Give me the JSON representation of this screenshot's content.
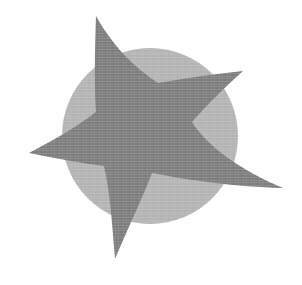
{
  "artwork": {
    "title": "Abstract star and circle graphic",
    "description": "A light gray filled circle overlaid by a larger dark gray five-pointed star with slightly curved, organic arms, on a plain white background.",
    "background_color": "#ffffff",
    "width": 302,
    "height": 285
  },
  "shapes": {
    "circle": {
      "name": "Light gray circle",
      "fill": "#b2b2b2",
      "center_x": 150,
      "center_y": 136,
      "radius": 88
    },
    "star": {
      "name": "Dark gray five-pointed star",
      "fill": "#7b7b7b",
      "point_count": 5,
      "outer_points": [
        {
          "label": "top",
          "x": 96,
          "y": 16
        },
        {
          "label": "upper-right",
          "x": 243,
          "y": 71
        },
        {
          "label": "lower-right",
          "x": 283,
          "y": 188
        },
        {
          "label": "bottom",
          "x": 115,
          "y": 259
        },
        {
          "label": "left",
          "x": 29,
          "y": 153
        }
      ],
      "inner_points": [
        {
          "label": "top-to-upper-right",
          "x": 158,
          "y": 83
        },
        {
          "label": "upper-right-to-lower-right",
          "x": 192,
          "y": 122
        },
        {
          "label": "lower-right-to-bottom",
          "x": 152,
          "y": 173
        },
        {
          "label": "bottom-to-left",
          "x": 104,
          "y": 166
        },
        {
          "label": "left-to-top",
          "x": 96,
          "y": 112
        }
      ],
      "path": "M 96 16 C 112 44 130 64 158 83 C 186 78 214 74 243 71 C 222 90 206 106 192 122 C 207 146 240 170 283 188 C 236 187 188 180 152 173 C 142 199 128 228 115 259 C 112 222 110 192 104 166 C 80 163 54 158 29 153 C 54 140 78 126 96 112 C 94 82 95 48 96 16 Z"
    }
  },
  "texture": {
    "name": "halftone-print-texture",
    "visible": true
  },
  "palette": {
    "background": "#ffffff",
    "circle_gray": "#b2b2b2",
    "star_gray": "#7b7b7b"
  }
}
